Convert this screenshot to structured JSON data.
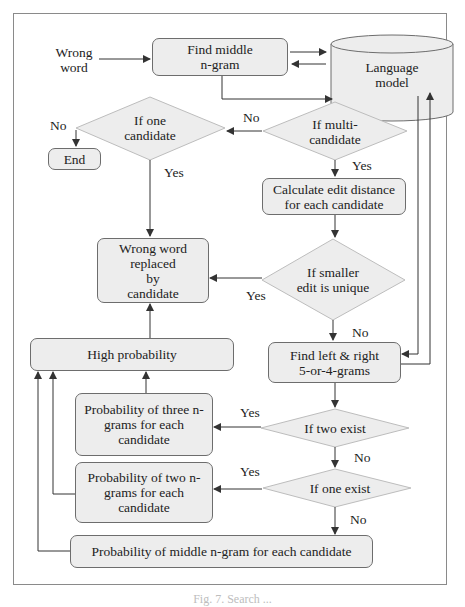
{
  "figure": {
    "caption": "Fig. 7. Search ..."
  },
  "nodes": {
    "input": {
      "label": "Wrong\nword"
    },
    "find_middle": {
      "label": "Find middle\nn-gram"
    },
    "language_model": {
      "label": "Language\nmodel"
    },
    "if_one_candidate": {
      "label": "If one\ncandidate"
    },
    "if_multi_candidate": {
      "label": "If multi-\ncandidate"
    },
    "end": {
      "label": "End"
    },
    "calc_edit": {
      "label": "Calculate edit distance\nfor each candidate"
    },
    "replaced": {
      "label": "Wrong word\nreplaced\nby\ncandidate"
    },
    "if_smaller_unique": {
      "label": "If smaller\nedit is unique"
    },
    "high_prob": {
      "label": "High probability"
    },
    "find_left_right": {
      "label": "Find left & right\n5-or-4-grams"
    },
    "prob_three": {
      "label": "Probability of three n-\ngrams for each\ncandidate"
    },
    "if_two_exist": {
      "label": "If two exist"
    },
    "prob_two": {
      "label": "Probability of two n-\ngrams for each\ncandidate"
    },
    "if_one_exist": {
      "label": "If one exist"
    },
    "prob_middle": {
      "label": "Probability of middle n-gram for each candidate"
    }
  },
  "edge_labels": {
    "one_no": "No",
    "one_yes": "Yes",
    "multi_no": "No",
    "multi_yes": "Yes",
    "unique_yes": "Yes",
    "unique_no": "No",
    "two_yes": "Yes",
    "two_no": "No",
    "oneexist_yes": "Yes",
    "oneexist_no": "No"
  },
  "colors": {
    "node_fill": "#ededed",
    "node_stroke": "#6d6d6d",
    "line": "#333333",
    "frame": "#8a8a8a"
  }
}
